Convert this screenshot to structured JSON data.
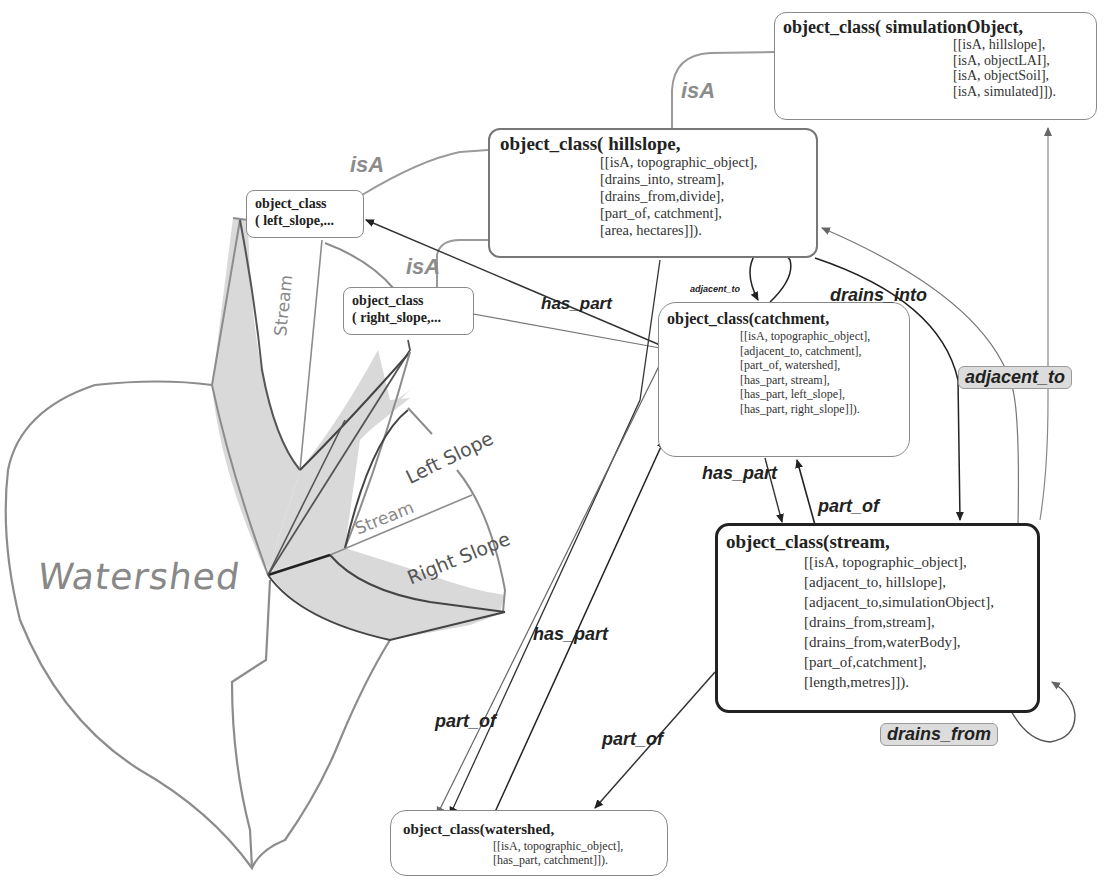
{
  "nodes": {
    "simulationObject": {
      "title": "object_class( simulationObject,",
      "attrs": [
        "[[isA, hillslope],",
        "[isA, objectLAI],",
        "[isA, objectSoil],",
        "[isA, simulated]])."
      ]
    },
    "hillslope": {
      "title": "object_class( hillslope,",
      "attrs": [
        "[[isA, topographic_object],",
        "[drains_into, stream],",
        "[drains_from,divide],",
        "[part_of, catchment],",
        "[area, hectares]])."
      ]
    },
    "left_slope": {
      "title_line1": "object_class",
      "title_line2": "( left_slope,..."
    },
    "right_slope": {
      "title_line1": "object_class",
      "title_line2": "( right_slope,..."
    },
    "catchment": {
      "title": "object_class(catchment,",
      "attrs": [
        "[[isA, topographic_object],",
        "[adjacent_to, catchment],",
        "[part_of, watershed],",
        "[has_part, stream],",
        "[has_part, left_slope],",
        "[has_part, right_slope]])."
      ]
    },
    "stream": {
      "title": "object_class(stream,",
      "attrs": [
        "[[isA, topographic_object],",
        "[adjacent_to, hillslope],",
        "[adjacent_to,simulationObject],",
        "[drains_from,stream],",
        "[drains_from,waterBody],",
        "[part_of,catchment],",
        "[length,metres]])."
      ]
    },
    "watershed": {
      "title": "object_class(watershed,",
      "attrs": [
        "[[isA, topographic_object],",
        "[has_part, catchment]])."
      ]
    }
  },
  "edge_labels": {
    "isA_sim": "isA",
    "isA_left": "isA",
    "isA_right": "isA",
    "has_part_top": "has_part",
    "adjacent_to_small": "adjacent_to",
    "drains_into": "drains_into",
    "adjacent_to_badge": "adjacent_to",
    "has_part_catch_stream": "has_part",
    "part_of_stream_catch": "part_of",
    "has_part_ws_catch": "has_part",
    "part_of_catch_ws": "part_of",
    "part_of_stream_ws": "part_of",
    "drains_from_badge": "drains_from"
  },
  "sketch_labels": {
    "watershed": "Watershed",
    "stream_vertical": "Stream",
    "stream_lower": "Stream",
    "left_slope": "Left Slope",
    "right_slope": "Right Slope"
  },
  "colors": {
    "sketch_line": "#8c8c8c",
    "sketch_fill": "#d9d9d9",
    "edge_dark": "#222222",
    "edge_gray": "#9a9a9a",
    "badge_fill": "#dcdcdc"
  }
}
